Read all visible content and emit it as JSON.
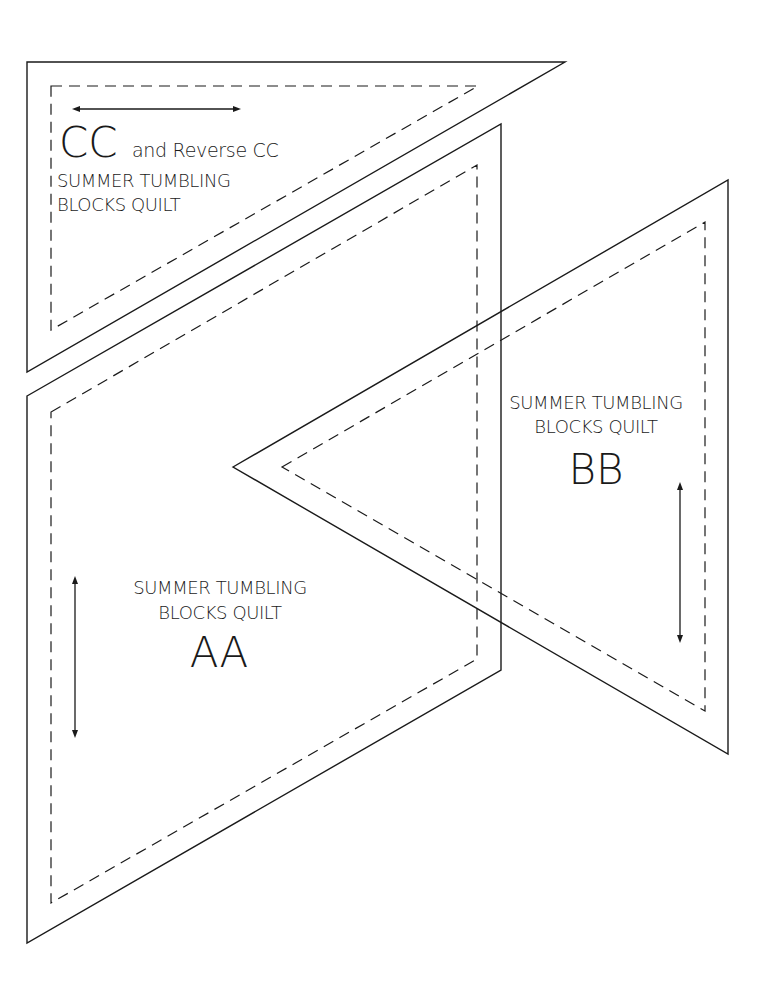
{
  "colors": {
    "line": "#1a1a1a",
    "background": "#ffffff"
  },
  "templates": {
    "cc": {
      "letter": "CC",
      "suffix": "and Reverse CC",
      "line1": "SUMMER TUMBLING",
      "line2": "BLOCKS QUILT",
      "grain_arrow": "horizontal"
    },
    "aa": {
      "letter": "AA",
      "line1": "SUMMER TUMBLING",
      "line2": "BLOCKS QUILT",
      "grain_arrow": "vertical"
    },
    "bb": {
      "letter": "BB",
      "line1": "SUMMER TUMBLING",
      "line2": "BLOCKS QUILT",
      "grain_arrow": "vertical"
    }
  }
}
